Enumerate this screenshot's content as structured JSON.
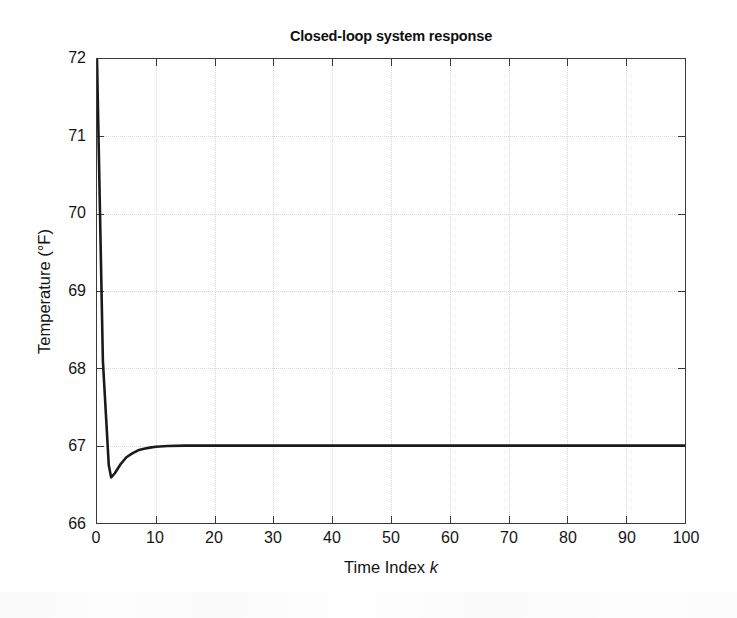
{
  "chart_data": {
    "type": "line",
    "title": "Closed-loop system response",
    "xlabel": "Time Index k",
    "xlabel_plain": "Time Index",
    "xlabel_italic": "k",
    "ylabel": "Temperature (°F)",
    "grid": "on",
    "legend": "none",
    "xlim": [
      0,
      100
    ],
    "ylim": [
      66,
      72
    ],
    "xticks": [
      0,
      10,
      20,
      30,
      40,
      50,
      60,
      70,
      80,
      90,
      100
    ],
    "yticks": [
      66,
      67,
      68,
      69,
      70,
      71,
      72
    ],
    "xticklabels": [
      "0",
      "10",
      "20",
      "30",
      "40",
      "50",
      "60",
      "70",
      "80",
      "90",
      "100"
    ],
    "yticklabels": [
      "66",
      "67",
      "68",
      "69",
      "70",
      "71",
      "72"
    ],
    "line_color": "#1a1a1a",
    "line_width": 2.6,
    "series": [
      {
        "name": "Closed-loop temperature response",
        "x": [
          0,
          1,
          2,
          2.4,
          3,
          4,
          5,
          6,
          7,
          8,
          9,
          10,
          12,
          15,
          20,
          30,
          40,
          50,
          60,
          70,
          80,
          90,
          100
        ],
        "values": [
          72.0,
          68.1,
          66.75,
          66.59,
          66.64,
          66.76,
          66.85,
          66.9,
          66.94,
          66.96,
          66.975,
          66.985,
          66.995,
          67.0,
          67.0,
          67.0,
          67.0,
          67.0,
          67.0,
          67.0,
          67.0,
          67.0,
          67.0
        ]
      }
    ],
    "annotations": {
      "initial_value": 72.0,
      "undershoot_minimum": 66.59,
      "undershoot_time_index": 2.4,
      "steady_state_value": 67.0,
      "settling_time_index": 10
    }
  }
}
